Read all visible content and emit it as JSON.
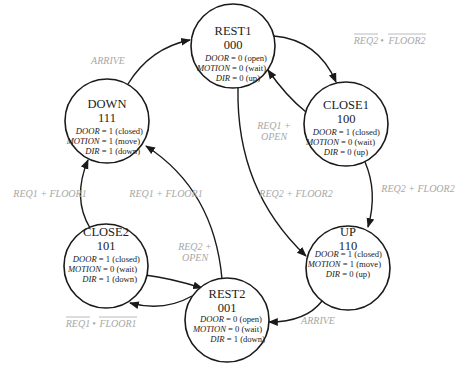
{
  "states": [
    {
      "id": "rest1",
      "name": "REST1",
      "code": "000",
      "cx": 233,
      "cy": 46,
      "r": 42,
      "outputs": [
        {
          "var": "DOOR",
          "val": " = 0 (open)"
        },
        {
          "var": "MOTION",
          "val": " = 0 (wait)"
        },
        {
          "var": "DIR",
          "val": " = 0 (up)"
        }
      ]
    },
    {
      "id": "close1",
      "name": "CLOSE1",
      "code": "100",
      "cx": 346,
      "cy": 124,
      "r": 42,
      "outputs": [
        {
          "var": "DOOR",
          "val": " = 1 (closed)"
        },
        {
          "var": "MOTION",
          "val": " = 0 (wait)"
        },
        {
          "var": "DIR",
          "val": " = 0 (up)"
        }
      ]
    },
    {
      "id": "up",
      "name": "UP",
      "code": "110",
      "cx": 348,
      "cy": 268,
      "r": 42,
      "outputs": [
        {
          "var": "DOOR",
          "val": " = 1 (closed)"
        },
        {
          "var": "MOTION",
          "val": " = 1 (move)"
        },
        {
          "var": "DIR",
          "val": " = 0 (up)"
        }
      ]
    },
    {
      "id": "rest2",
      "name": "REST2",
      "code": "001",
      "cx": 227,
      "cy": 320,
      "r": 42,
      "outputs": [
        {
          "var": "DOOR",
          "val": " = 0 (open)"
        },
        {
          "var": "MOTION",
          "val": " = 0 (wait)"
        },
        {
          "var": "DIR",
          "val": " = 1 (down)"
        }
      ]
    },
    {
      "id": "close2",
      "name": "CLOSE2",
      "code": "101",
      "cx": 106,
      "cy": 266,
      "r": 42,
      "outputs": [
        {
          "var": "DOOR",
          "val": " = 1 (closed)"
        },
        {
          "var": "MOTION",
          "val": " = 0 (wait)"
        },
        {
          "var": "DIR",
          "val": " = 1 (down)"
        }
      ]
    },
    {
      "id": "down",
      "name": "DOWN",
      "code": "111",
      "cx": 107,
      "cy": 121,
      "r": 42,
      "outputs": [
        {
          "var": "DOOR",
          "val": " = 1 (closed)"
        },
        {
          "var": "MOTION",
          "val": " = 1 (move)"
        },
        {
          "var": "DIR",
          "val": " = 1 (down)"
        }
      ]
    }
  ],
  "transitions": [
    {
      "id": "rest1-close1",
      "from": "REST1",
      "to": "CLOSE1",
      "label": "REQ2 • FLOOR2",
      "overbar": true
    },
    {
      "id": "close1-rest1",
      "from": "CLOSE1",
      "to": "REST1",
      "label_lines": [
        "REQ1 +",
        "OPEN"
      ]
    },
    {
      "id": "rest1-up",
      "from": "REST1",
      "to": "UP",
      "label": "REQ2 + FLOOR2"
    },
    {
      "id": "close1-up",
      "from": "CLOSE1",
      "to": "UP",
      "label": "REQ2 + FLOOR2"
    },
    {
      "id": "up-rest2",
      "from": "UP",
      "to": "REST2",
      "label": "ARRIVE"
    },
    {
      "id": "rest2-close2",
      "from": "REST2",
      "to": "CLOSE2",
      "label": "REQ1 • FLOOR1",
      "overbar": true
    },
    {
      "id": "close2-rest2",
      "from": "CLOSE2",
      "to": "REST2",
      "label_lines": [
        "REQ2 +",
        "OPEN"
      ]
    },
    {
      "id": "rest2-down",
      "from": "REST2",
      "to": "DOWN",
      "label": "REQ1 + FLOOR1"
    },
    {
      "id": "close2-down",
      "from": "CLOSE2",
      "to": "DOWN",
      "label": "REQ1 + FLOOR1"
    },
    {
      "id": "down-rest1",
      "from": "DOWN",
      "to": "REST1",
      "label": "ARRIVE"
    }
  ],
  "labels": {
    "rest1_close1_a": "REQ2",
    "rest1_close1_dot": "•",
    "rest1_close1_b": "FLOOR2",
    "close1_rest1_l1": "REQ1 +",
    "close1_rest1_l2": "OPEN",
    "rest1_up": "REQ2 + FLOOR2",
    "close1_up": "REQ2 + FLOOR2",
    "up_rest2": "ARRIVE",
    "rest2_close2_a": "REQ1",
    "rest2_close2_dot": "•",
    "rest2_close2_b": "FLOOR1",
    "close2_rest2_l1": "REQ2 +",
    "close2_rest2_l2": "OPEN",
    "rest2_down": "REQ1 + FLOOR1",
    "close2_down": "REQ1 + FLOOR1",
    "down_rest1": "ARRIVE"
  }
}
